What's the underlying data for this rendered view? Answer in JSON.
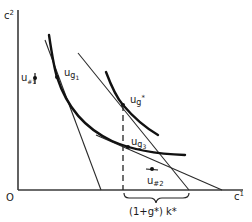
{
  "diagram": {
    "type": "economics-indifference-curve-diagram",
    "axes": {
      "x_label": "c",
      "x_label_sup": "1",
      "y_label": "c",
      "y_label_sup": "2",
      "origin_label": "O"
    },
    "curves": [
      {
        "id": "ug1",
        "label_main": "u",
        "label_sub": "g",
        "label_subsub": "1"
      },
      {
        "id": "ugstar",
        "label_main": "u",
        "label_sub": "g",
        "label_sup": "*"
      },
      {
        "id": "ug3",
        "label_main": "u",
        "label_sub": "g",
        "label_subsub": "3"
      }
    ],
    "points": [
      {
        "id": "u_hash1",
        "label_main": "u",
        "label_sub": "#1"
      },
      {
        "id": "u_hash2",
        "label_main": "u",
        "label_sub": "#2"
      }
    ],
    "budget_lines": 3,
    "brace_label": "(1+g*) k*",
    "colors": {
      "ink": "#1a1a1a",
      "background": "#ffffff"
    }
  }
}
